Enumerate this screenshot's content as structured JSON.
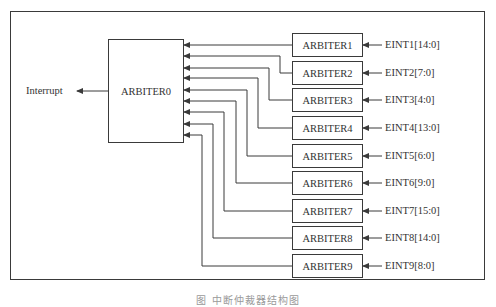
{
  "diagram": {
    "output_label": "Interrupt",
    "main_block": "ARBITER0",
    "sub_arbiters": [
      {
        "name": "ARBITER1",
        "input": "EINT1[14:0]"
      },
      {
        "name": "ARBITER2",
        "input": "EINT2[7:0]"
      },
      {
        "name": "ARBITER3",
        "input": "EINT3[4:0]"
      },
      {
        "name": "ARBITER4",
        "input": "EINT4[13:0]"
      },
      {
        "name": "ARBITER5",
        "input": "EINT5[6:0]"
      },
      {
        "name": "ARBITER6",
        "input": "EINT6[9:0]"
      },
      {
        "name": "ARBITER7",
        "input": "EINT7[15:0]"
      },
      {
        "name": "ARBITER8",
        "input": "EINT8[14:0]"
      },
      {
        "name": "ARBITER9",
        "input": "EINT9[8:0]"
      }
    ],
    "caption": "图 中断仲裁器结构图",
    "colors": {
      "line": "#3a3a3a",
      "frame": "#3a3a3a",
      "background": "#ffffff"
    }
  }
}
